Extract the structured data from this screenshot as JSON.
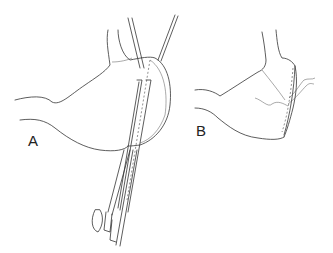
{
  "figure": {
    "panels": [
      {
        "id": "A",
        "label": "A",
        "description": "stomach with stapling device applied across fundus"
      },
      {
        "id": "B",
        "label": "B",
        "description": "stomach after stapled closure with sutures"
      }
    ]
  },
  "colors": {
    "background": "#ffffff",
    "line": "#333333"
  }
}
